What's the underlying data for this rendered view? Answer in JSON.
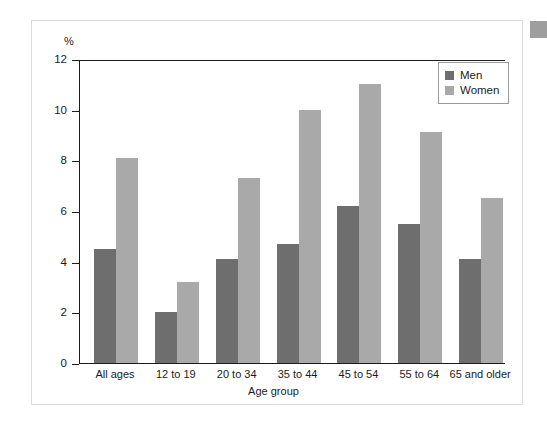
{
  "chart_data": {
    "type": "bar",
    "title": "",
    "xlabel": "Age group",
    "ylabel": "%",
    "ylim": [
      0,
      12
    ],
    "yticks": [
      0,
      2,
      4,
      6,
      8,
      10,
      12
    ],
    "grid": false,
    "legend_position": "top-right",
    "categories": [
      "All ages",
      "12 to 19",
      "20 to 34",
      "35 to 44",
      "45 to 54",
      "55 to 64",
      "65 and older"
    ],
    "series": [
      {
        "name": "Men",
        "color": "#6e6e6e",
        "values": [
          4.5,
          2.0,
          4.1,
          4.7,
          6.2,
          5.5,
          4.1
        ]
      },
      {
        "name": "Women",
        "color": "#a9a9a9",
        "values": [
          8.1,
          3.2,
          7.3,
          10.0,
          11.0,
          9.1,
          6.5
        ]
      }
    ]
  },
  "legend": {
    "items": [
      {
        "label": "Men"
      },
      {
        "label": "Women"
      }
    ]
  },
  "colors": {
    "men": "#6e6e6e",
    "women": "#a9a9a9",
    "axis": "#1c1c1c",
    "frame": "#dcdcdc",
    "corner_square": "#9e9e9e"
  }
}
